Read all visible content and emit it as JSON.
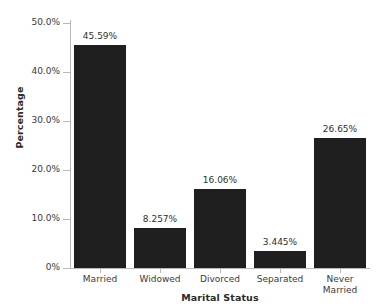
{
  "chart_data": {
    "type": "bar",
    "title": "",
    "xlabel": "Marital Status",
    "ylabel": "Percentage",
    "categories": [
      "Married",
      "Widowed",
      "Divorced",
      "Separated",
      "Never Married"
    ],
    "category_display": [
      "Married",
      "Widowed",
      "Divorced",
      "Separated",
      "Never\nMarried"
    ],
    "values": [
      45.59,
      8.257,
      16.06,
      3.445,
      26.65
    ],
    "value_labels": [
      "45.59%",
      "8.257%",
      "16.06%",
      "3.445%",
      "26.65%"
    ],
    "ylim": [
      0,
      50.7
    ],
    "yticks": [
      0,
      10,
      20,
      30,
      40,
      50
    ],
    "ytick_labels": [
      "0%",
      "10.0%",
      "20.0%",
      "30.0%",
      "40.0%",
      "50.0%"
    ],
    "grid": false,
    "legend": null,
    "bar_color": "#1f1f1f",
    "axis_color": "#b9b9b9",
    "text_color": "#3a3a3a",
    "background": "#ffffff"
  }
}
